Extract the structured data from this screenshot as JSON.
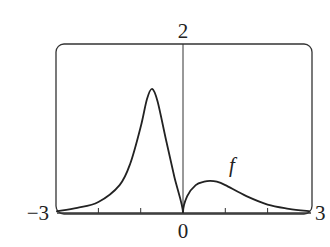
{
  "chart_data": {
    "type": "line",
    "title": "",
    "xlabel": "",
    "ylabel": "",
    "xlim": [
      -3,
      3
    ],
    "ylim": [
      0,
      2
    ],
    "grid": false,
    "tick_labels": {
      "x_min": "−3",
      "x_max": "3",
      "x_zero": "0",
      "y_max": "2"
    },
    "x_ticks": [
      -2,
      -1,
      1,
      2
    ],
    "series": [
      {
        "name": "f",
        "x": [
          -3,
          -2.5,
          -2,
          -1.5,
          -1.25,
          -1,
          -0.85,
          -0.73,
          -0.6,
          -0.4,
          -0.2,
          0,
          0.1,
          0.3,
          0.5,
          0.64,
          0.8,
          1,
          1.5,
          2,
          2.5,
          3
        ],
        "values": [
          0.02,
          0.06,
          0.13,
          0.33,
          0.58,
          1.02,
          1.35,
          1.47,
          1.32,
          0.86,
          0.42,
          0.0,
          0.2,
          0.33,
          0.37,
          0.38,
          0.37,
          0.33,
          0.2,
          0.1,
          0.05,
          0.02
        ]
      }
    ],
    "annotations": [
      {
        "text": "f",
        "x": 1.1,
        "y": 0.55
      }
    ]
  }
}
